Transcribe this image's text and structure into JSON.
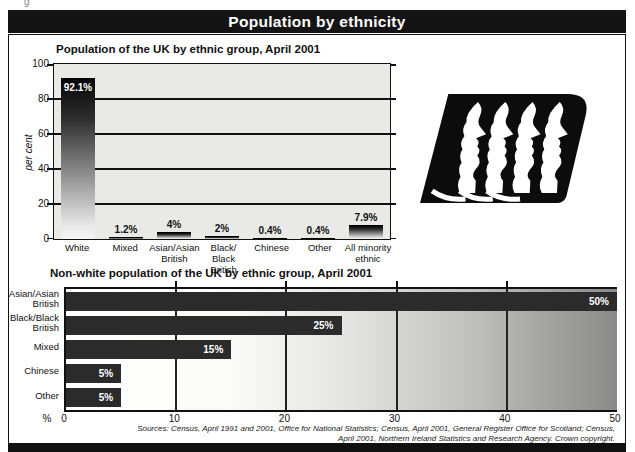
{
  "page": {
    "header_title": "Population by ethnicity",
    "corner_fragment": "g",
    "source_line1": "Sources: Census, April 1991 and 2001, Office for National Statistics; Census, April 2001, General Register Office for Scotland; Census,",
    "source_line2": "April 2001, Northern Ireland Statistics and Research Agency. Crown copyright."
  },
  "chart_data": [
    {
      "type": "bar",
      "orientation": "vertical",
      "title": "Population of the UK by ethnic group, April 2001",
      "ylabel": "per cent",
      "ylim": [
        0,
        100
      ],
      "yticks": [
        0,
        20,
        40,
        60,
        80,
        100
      ],
      "grid": "horizontal",
      "categories": [
        [
          "White"
        ],
        [
          "Mixed"
        ],
        [
          "Asian/Asian",
          "British"
        ],
        [
          "Black/",
          "Black British"
        ],
        [
          "Chinese"
        ],
        [
          "Other"
        ],
        [
          "All minority",
          "ethnic"
        ]
      ],
      "values": [
        92.1,
        1.2,
        4,
        2,
        0.4,
        0.4,
        7.9
      ],
      "value_labels": [
        "92.1%",
        "1.2%",
        "4%",
        "2%",
        "0.4%",
        "0.4%",
        "7.9%"
      ],
      "bar_style": "dark-to-light-gradient",
      "plot_bg": "#e9e9e6"
    },
    {
      "type": "bar",
      "orientation": "horizontal",
      "title": "Non-white population of the UK by ethnic group, April 2001",
      "xlabel": "%",
      "xlim": [
        0,
        50
      ],
      "xticks": [
        0,
        10,
        20,
        30,
        40,
        50
      ],
      "grid": "vertical",
      "categories": [
        [
          "Asian/Asian",
          "British"
        ],
        [
          "Black/Black",
          "British"
        ],
        [
          "Mixed"
        ],
        [
          "Chinese"
        ],
        [
          "Other"
        ]
      ],
      "values": [
        50,
        25,
        15,
        5,
        5
      ],
      "value_labels": [
        "50%",
        "25%",
        "15%",
        "5%",
        "5%"
      ],
      "bar_color": "#2b2b2b",
      "plot_bg": "white-to-gray-gradient"
    }
  ],
  "colors": {
    "header_bg": "#141414",
    "header_text": "#ffffff",
    "grid": "#111111",
    "bottom_bar": "#2b2b2b"
  }
}
